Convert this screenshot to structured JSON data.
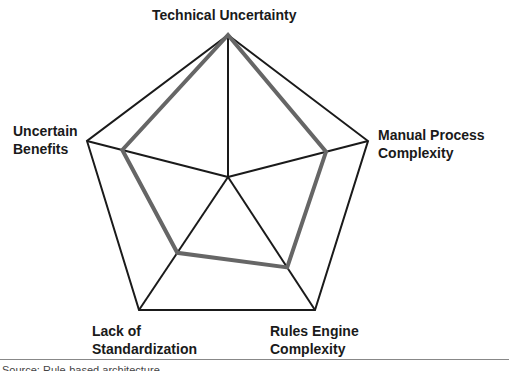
{
  "chart_data": {
    "type": "radar",
    "title": "",
    "axes": [
      "Technical Uncertainty",
      "Manual Process Complexity",
      "Rules Engine Complexity",
      "Lack of Standardization",
      "Uncertain Benefits"
    ],
    "series": [
      {
        "name": "Profile",
        "values": [
          1.0,
          0.7,
          0.68,
          0.57,
          0.75
        ],
        "color": "#666666"
      }
    ],
    "range": [
      0,
      1
    ],
    "grid": "outer pentagon with spokes",
    "legend": "none"
  },
  "labels": {
    "top": "Technical Uncertainty",
    "right": "Manual Process\nComplexity",
    "bottom_right": "Rules Engine\nComplexity",
    "bottom_left": "Lack of\nStandardization",
    "left": "Uncertain\nBenefits"
  },
  "caption": "Source: Rule-based architecture"
}
